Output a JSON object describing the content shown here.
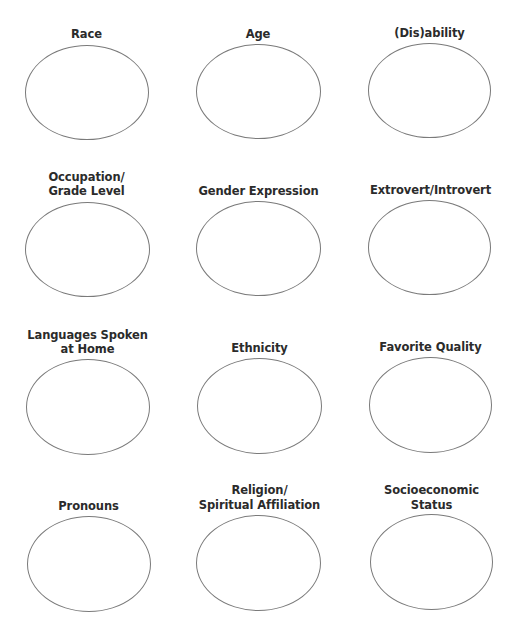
{
  "worksheet": {
    "items": [
      {
        "lines": [
          "Race"
        ]
      },
      {
        "lines": [
          "Age"
        ]
      },
      {
        "lines": [
          "(Dis)ability"
        ]
      },
      {
        "lines": [
          "Occupation/",
          "Grade Level"
        ]
      },
      {
        "lines": [
          "Gender Expression"
        ]
      },
      {
        "lines": [
          "Extrovert/Introvert"
        ]
      },
      {
        "lines": [
          "Languages Spoken",
          "at Home"
        ]
      },
      {
        "lines": [
          "Ethnicity"
        ]
      },
      {
        "lines": [
          "Favorite Quality"
        ]
      },
      {
        "lines": [
          "Pronouns"
        ]
      },
      {
        "lines": [
          "Religion/",
          "Spiritual Affiliation"
        ]
      },
      {
        "lines": [
          "Socioeconomic",
          "Status"
        ]
      }
    ]
  }
}
